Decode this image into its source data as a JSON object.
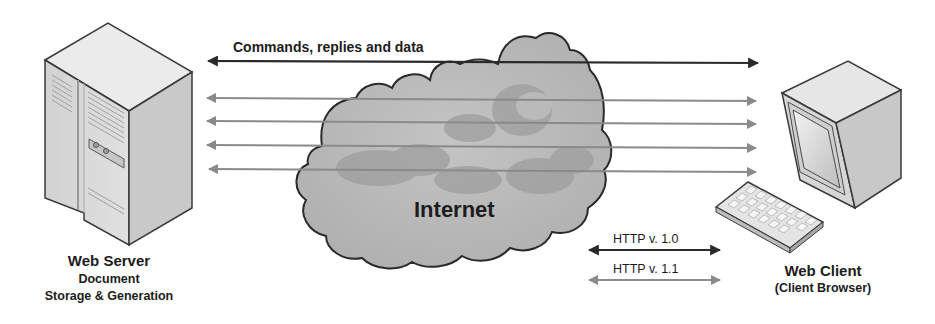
{
  "diagram": {
    "title": "",
    "nodes": {
      "server": {
        "name": "Web Server",
        "subtitle_line1": "Document",
        "subtitle_line2": "Storage & Generation",
        "icon": "server-tower-icon"
      },
      "internet": {
        "name": "Internet",
        "icon": "cloud-icon"
      },
      "client": {
        "name": "Web Client",
        "subtitle": "(Client Browser)",
        "icon": "desktop-computer-icon"
      }
    },
    "connections": {
      "main": {
        "label": "Commands, replies and data",
        "direction": "bidirectional",
        "color": "#2a2a2a"
      },
      "parallel_count": 4,
      "parallel_color": "#8a8a8a"
    },
    "legend": [
      {
        "label": "HTTP v. 1.0",
        "color": "#2a2a2a",
        "direction": "bidirectional"
      },
      {
        "label": "HTTP v. 1.1",
        "color": "#8a8a8a",
        "direction": "bidirectional"
      }
    ],
    "colors": {
      "cloud_fill": "#b9b9b9",
      "cloud_dark": "#9a9a9a",
      "cloud_outline": "#2a2a2a",
      "device_fill": "#dcdcdc",
      "device_outline": "#3a3a3a"
    }
  }
}
